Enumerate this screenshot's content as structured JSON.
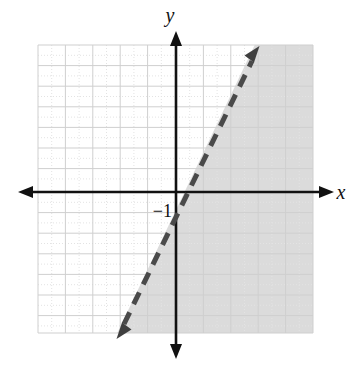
{
  "figure": {
    "title": "",
    "type": "coordinate-plane-linear-inequality",
    "axis_labels": {
      "x": "x",
      "y": "y"
    },
    "tick_labels": [
      {
        "text": "−1",
        "axis": "y",
        "value": -1
      }
    ],
    "colors": {
      "background": "#ffffff",
      "grid_major": "#d9d9d9",
      "grid_minor": "#e6e6e6",
      "axis": "#111111",
      "line": "#4a4a4a",
      "shading": "#d9d9d9"
    },
    "grid": {
      "x_min": -7,
      "x_max": 5,
      "y_min": -7,
      "y_max": 7,
      "cell_width_px": 27.4,
      "cell_height_px": 20.6,
      "minor_divisions": 2,
      "show_grid": true
    },
    "axes": {
      "x_axis_arrows": "both",
      "y_axis_arrows": "both",
      "origin_px": {
        "x": 176,
        "y": 192
      }
    },
    "line": {
      "style": "dashed",
      "arrows": "both",
      "slope": 3,
      "y_intercept": -1,
      "equation": "y = 3x − 1",
      "points": [
        {
          "x": 0,
          "y": -1
        },
        {
          "x": 1,
          "y": 2
        }
      ]
    },
    "shaded_region": {
      "side": "right",
      "description": "region to the right of / below the dashed line",
      "boundary_included": false
    }
  }
}
